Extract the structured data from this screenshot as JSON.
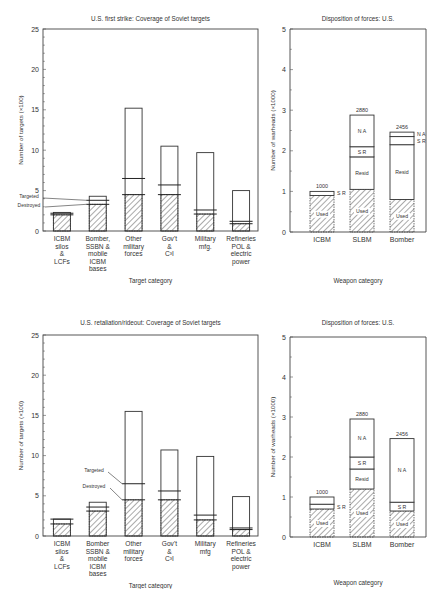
{
  "chart_data": [
    {
      "id": "first_strike_coverage",
      "type": "bar",
      "title": "U.S. first strike: Coverage of Soviet targets",
      "xlabel": "Target category",
      "ylabel": "Number of targets (×100)",
      "ylim": [
        0,
        25
      ],
      "yticks": [
        0,
        5,
        10,
        15,
        20,
        25
      ],
      "grid": false,
      "categories": [
        [
          "ICBM",
          "silos",
          "&",
          "LCFs"
        ],
        [
          "Bomber,",
          "SSBN &",
          "mobile",
          "ICBM",
          "bases"
        ],
        [
          "Other",
          "military",
          "forces"
        ],
        [
          "Gov't",
          "&",
          "C³I"
        ],
        [
          "Military",
          "mfg."
        ],
        [
          "Refineries",
          "POL &",
          "electric",
          "power"
        ]
      ],
      "series": [
        {
          "name": "Total targets",
          "values": [
            2.3,
            4.3,
            15.2,
            10.5,
            9.7,
            5.0
          ]
        },
        {
          "name": "Targeted",
          "values": [
            2.2,
            3.8,
            6.5,
            5.7,
            2.6,
            1.2
          ]
        },
        {
          "name": "Destroyed",
          "values": [
            2.0,
            3.3,
            4.5,
            4.5,
            2.1,
            0.9
          ]
        }
      ],
      "annotations": [
        "Targeted",
        "Destroyed"
      ]
    },
    {
      "id": "first_strike_disposition",
      "type": "bar",
      "stacked": true,
      "title": "Disposition of forces: U.S.",
      "xlabel": "Weapon category",
      "ylabel": "Number of warheads (×1000)",
      "ylim": [
        0,
        5
      ],
      "yticks": [
        0,
        1,
        2,
        3,
        4,
        5
      ],
      "grid": false,
      "categories": [
        "ICBM",
        "SLBM",
        "Bomber"
      ],
      "totals": [
        1000,
        2880,
        2456
      ],
      "series": [
        {
          "name": "Used",
          "values": [
            0.9,
            1.05,
            0.8
          ]
        },
        {
          "name": "Resid",
          "values": [
            0,
            0.8,
            1.35
          ]
        },
        {
          "name": "S R",
          "values": [
            0.1,
            0.25,
            0.2
          ]
        },
        {
          "name": "N A",
          "values": [
            0,
            0.78,
            0.11
          ]
        }
      ]
    },
    {
      "id": "retaliation_coverage",
      "type": "bar",
      "title": "U.S. retaliation/rideout: Coverage of Soviet targets",
      "xlabel": "Target category",
      "ylabel": "Number of targets (×100)",
      "ylim": [
        0,
        25
      ],
      "yticks": [
        0,
        5,
        10,
        15,
        20,
        25
      ],
      "grid": false,
      "categories": [
        [
          "ICBM",
          "silos",
          "&",
          "LCFs"
        ],
        [
          "Bomber",
          "SSBN &",
          "mobile",
          "ICBM",
          "bases"
        ],
        [
          "Other",
          "military",
          "forces"
        ],
        [
          "Gov't",
          "&",
          "C³I"
        ],
        [
          "Military",
          "mfg"
        ],
        [
          "Refineries",
          "POL &",
          "electric",
          "power"
        ]
      ],
      "series": [
        {
          "name": "Total targets",
          "values": [
            2.1,
            4.2,
            15.5,
            10.7,
            9.9,
            4.9
          ]
        },
        {
          "name": "Targeted",
          "values": [
            2.1,
            3.6,
            6.5,
            5.6,
            2.6,
            1.0
          ]
        },
        {
          "name": "Destroyed",
          "values": [
            1.5,
            3.1,
            4.5,
            4.5,
            2.0,
            0.8
          ]
        }
      ],
      "annotations": [
        "Targeted",
        "Destroyed"
      ]
    },
    {
      "id": "retaliation_disposition",
      "type": "bar",
      "stacked": true,
      "title": "Disposition of forces: U.S.",
      "xlabel": "Weapon category",
      "ylabel": "Number of warheads (×1000)",
      "ylim": [
        0,
        5
      ],
      "yticks": [
        0,
        1,
        2,
        3,
        4,
        5
      ],
      "grid": false,
      "categories": [
        "ICBM",
        "SLBM",
        "Bomber"
      ],
      "totals": [
        1000,
        2880,
        2456
      ],
      "series": [
        {
          "name": "Used",
          "values": [
            0.7,
            1.2,
            0.65
          ]
        },
        {
          "name": "Resid",
          "values": [
            0,
            0.5,
            0
          ]
        },
        {
          "name": "S R",
          "values": [
            0.12,
            0.3,
            0.22
          ]
        },
        {
          "name": "N A",
          "values": [
            0.18,
            0.95,
            1.59
          ]
        }
      ]
    }
  ],
  "labels": {
    "annot_targeted": "Targeted",
    "annot_destroyed": "Destroyed",
    "used": "Used",
    "resid": "Resid",
    "sr": "S R",
    "na": "N A"
  }
}
